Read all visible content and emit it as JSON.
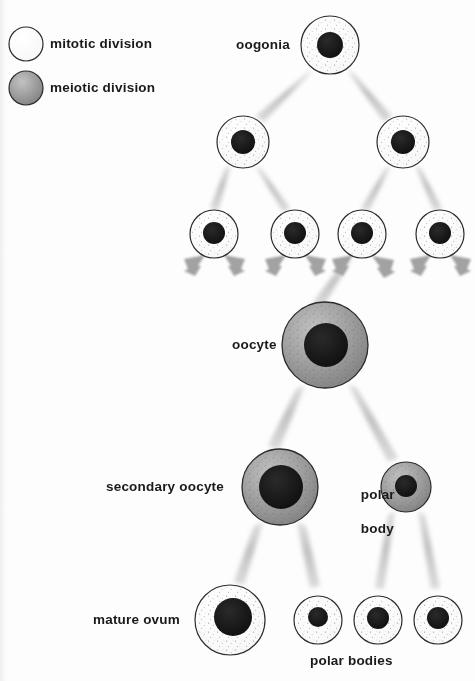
{
  "diagram": {
    "background_color": "#fdfdfd",
    "legend": {
      "items": [
        {
          "label": "mitotic division",
          "swatch": "mitotic-cell",
          "fill": "#ffffff",
          "stroke": "#2b2b2b"
        },
        {
          "label": "meiotic division",
          "swatch": "meiotic-cell",
          "fill": "#9a9a9a",
          "stroke": "#2b2b2b"
        }
      ]
    },
    "labels": {
      "oogonia": "oogonia",
      "oocyte": "oocyte",
      "secondary_oocyte": "secondary oocyte",
      "polar_body": "polar\nbody",
      "polar_body_line1": "polar",
      "polar_body_line2": "body",
      "mature_ovum": "mature ovum",
      "polar_bodies": "polar bodies"
    },
    "colors": {
      "nucleus": "#151515",
      "cell_outline": "#2b2b2b",
      "mitotic_fill": "#ffffff",
      "meiotic_fill": "#9a9a9a",
      "connector": "#b9b9b9",
      "arrow": "#a5a5a5",
      "text": "#1a1a1a"
    },
    "cells": [
      {
        "id": "oogonia",
        "type": "mitotic",
        "cx": 330,
        "cy": 45,
        "r": 29,
        "nucleus_r": 13,
        "row": 1
      },
      {
        "id": "oogonia-2a",
        "type": "mitotic",
        "cx": 243,
        "cy": 142,
        "r": 26,
        "nucleus_r": 12,
        "row": 2
      },
      {
        "id": "oogonia-2b",
        "type": "mitotic",
        "cx": 403,
        "cy": 142,
        "r": 26,
        "nucleus_r": 12,
        "row": 2
      },
      {
        "id": "oogonia-3a",
        "type": "mitotic",
        "cx": 214,
        "cy": 234,
        "r": 24,
        "nucleus_r": 11,
        "row": 3
      },
      {
        "id": "oogonia-3b",
        "type": "mitotic",
        "cx": 295,
        "cy": 234,
        "r": 24,
        "nucleus_r": 11,
        "row": 3
      },
      {
        "id": "oogonia-3c",
        "type": "mitotic",
        "cx": 362,
        "cy": 234,
        "r": 24,
        "nucleus_r": 11,
        "row": 3
      },
      {
        "id": "oogonia-3d",
        "type": "mitotic",
        "cx": 440,
        "cy": 234,
        "r": 24,
        "nucleus_r": 11,
        "row": 3
      },
      {
        "id": "oocyte",
        "type": "meiotic",
        "cx": 325,
        "cy": 345,
        "r": 43,
        "nucleus_r": 22,
        "row": 4
      },
      {
        "id": "secondary-oocyte",
        "type": "meiotic",
        "cx": 280,
        "cy": 487,
        "r": 38,
        "nucleus_r": 22,
        "row": 5
      },
      {
        "id": "polar-body-1",
        "type": "meiotic",
        "cx": 406,
        "cy": 487,
        "r": 25,
        "nucleus_r": 11,
        "row": 5
      },
      {
        "id": "mature-ovum",
        "type": "mitotic",
        "cx": 230,
        "cy": 620,
        "r": 35,
        "nucleus_r": 19,
        "row": 6
      },
      {
        "id": "polar-body-2",
        "type": "mitotic",
        "cx": 318,
        "cy": 620,
        "r": 24,
        "nucleus_r": 10,
        "row": 6
      },
      {
        "id": "polar-body-3",
        "type": "mitotic",
        "cx": 378,
        "cy": 620,
        "r": 24,
        "nucleus_r": 11,
        "row": 6
      },
      {
        "id": "polar-body-4",
        "type": "mitotic",
        "cx": 438,
        "cy": 620,
        "r": 24,
        "nucleus_r": 11,
        "row": 6
      }
    ],
    "connections": [
      {
        "from": "oogonia",
        "to": "oogonia-2a",
        "style": "taper"
      },
      {
        "from": "oogonia",
        "to": "oogonia-2b",
        "style": "taper"
      },
      {
        "from": "oogonia-2a",
        "to": "oogonia-3a",
        "style": "taper"
      },
      {
        "from": "oogonia-2a",
        "to": "oogonia-3b",
        "style": "taper"
      },
      {
        "from": "oogonia-2b",
        "to": "oogonia-3c",
        "style": "taper"
      },
      {
        "from": "oogonia-2b",
        "to": "oogonia-3d",
        "style": "taper"
      },
      {
        "from": "oogonia-3c",
        "to": "oocyte",
        "style": "taper"
      },
      {
        "from": "oocyte",
        "to": "secondary-oocyte",
        "style": "taper"
      },
      {
        "from": "oocyte",
        "to": "polar-body-1",
        "style": "taper"
      },
      {
        "from": "secondary-oocyte",
        "to": "mature-ovum",
        "style": "taper"
      },
      {
        "from": "secondary-oocyte",
        "to": "polar-body-2",
        "style": "taper"
      },
      {
        "from": "polar-body-1",
        "to": "polar-body-3",
        "style": "taper"
      },
      {
        "from": "polar-body-1",
        "to": "polar-body-4",
        "style": "taper"
      }
    ],
    "arrow_pairs": [
      {
        "at_cell": "oogonia-3a",
        "count": 2
      },
      {
        "at_cell": "oogonia-3b",
        "count": 2
      },
      {
        "at_cell": "oogonia-3c",
        "count": 2
      },
      {
        "at_cell": "oogonia-3d",
        "count": 2
      }
    ]
  }
}
